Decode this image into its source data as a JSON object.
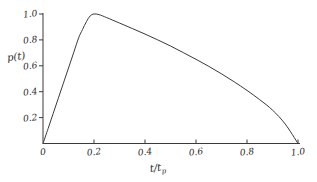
{
  "chart_data": {
    "type": "line",
    "title": "",
    "subtitle": "",
    "xlabel": "t/t",
    "xlabel_sub": "p",
    "ylabel": "p(t)",
    "xlim": [
      0,
      1.0
    ],
    "ylim": [
      0,
      1.0
    ],
    "grid": false,
    "legend": null,
    "xticks": [
      "0",
      "0.2",
      "0.4",
      "0.6",
      "0.8",
      "1.0"
    ],
    "xtick_values": [
      0,
      0.2,
      0.4,
      0.6,
      0.8,
      1.0
    ],
    "yticks": [
      "0.2",
      "0.4",
      "0.6",
      "0.8",
      "1.0"
    ],
    "ytick_values": [
      0.2,
      0.4,
      0.6,
      0.8,
      1.0
    ],
    "series": [
      {
        "name": "p(t)",
        "color": "#3a3a3a",
        "x": [
          0.0,
          0.02,
          0.04,
          0.06,
          0.08,
          0.1,
          0.12,
          0.14,
          0.155,
          0.17,
          0.185,
          0.2,
          0.22,
          0.25,
          0.3,
          0.35,
          0.4,
          0.45,
          0.5,
          0.55,
          0.6,
          0.65,
          0.7,
          0.75,
          0.8,
          0.85,
          0.9,
          0.95,
          1.0
        ],
        "y": [
          0.0,
          0.115,
          0.232,
          0.349,
          0.466,
          0.583,
          0.7,
          0.817,
          0.88,
          0.94,
          0.985,
          1.0,
          0.995,
          0.972,
          0.93,
          0.888,
          0.845,
          0.8,
          0.753,
          0.702,
          0.65,
          0.596,
          0.538,
          0.476,
          0.41,
          0.338,
          0.258,
          0.15,
          0.0
        ]
      }
    ],
    "peak": {
      "x": 0.195,
      "y": 1.0
    }
  },
  "axes": {
    "y_axis_name": "vertical-axis",
    "x_axis_name": "horizontal-axis"
  }
}
